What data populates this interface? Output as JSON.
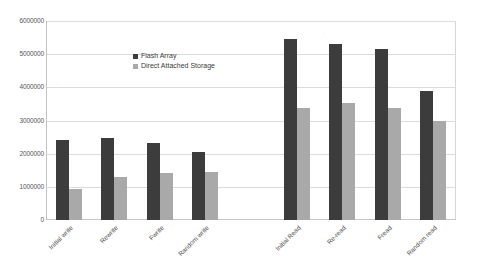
{
  "chart_data": {
    "type": "bar",
    "title": "",
    "xlabel": "",
    "ylabel": "",
    "ylim": [
      0,
      6000000
    ],
    "ytick_values": [
      6000000,
      5000000,
      4000000,
      3000000,
      2000000,
      1000000,
      0
    ],
    "ytick_labels": [
      "6000000",
      "5000000",
      "4000000",
      "3000000",
      "2000000",
      "1000000",
      "0"
    ],
    "grid": true,
    "legend_position": "inside-top-center",
    "categories": [
      "Initial write",
      "Rewrite",
      "Fwrite",
      "Random write",
      "",
      "Initial Read",
      "Re-read",
      "Fread",
      "Random read"
    ],
    "series": [
      {
        "name": "Flash Array",
        "color": "#3c3c3c",
        "values": [
          2400000,
          2480000,
          2330000,
          2050000,
          null,
          5470000,
          5300000,
          5170000,
          3900000
        ]
      },
      {
        "name": "Direct Attached Storage",
        "color": "#a9a9a9",
        "values": [
          950000,
          1300000,
          1420000,
          1450000,
          null,
          3380000,
          3540000,
          3370000,
          3000000
        ]
      }
    ]
  },
  "legend": {
    "items": [
      {
        "label": "Flash Array"
      },
      {
        "label": "Direct Attached Storage"
      }
    ]
  }
}
